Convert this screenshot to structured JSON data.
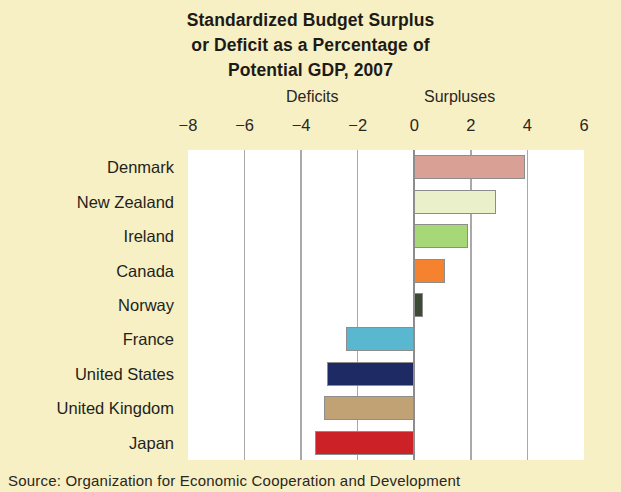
{
  "figure": {
    "title_lines": [
      "Standardized Budget Surplus",
      "or Deficit as a Percentage of",
      "Potential GDP, 2007"
    ],
    "deficits_label": "Deficits",
    "surpluses_label": "Surpluses",
    "source_note": "Source: Organization for Economic Cooperation and Development"
  },
  "chart_data": {
    "type": "bar",
    "orientation": "horizontal",
    "title": "Standardized Budget Surplus or Deficit as a Percentage of Potential GDP, 2007",
    "xlabel": "",
    "ylabel": "",
    "xlim": [
      -8,
      6
    ],
    "xticks": [
      -8,
      -6,
      -4,
      -2,
      0,
      2,
      4,
      6
    ],
    "xticklabels": [
      "−8",
      "−6",
      "−4",
      "−2",
      "0",
      "2",
      "4",
      "6"
    ],
    "grid": true,
    "legend": false,
    "annotations": [
      "Deficits",
      "Surpluses"
    ],
    "categories": [
      "Denmark",
      "New Zealand",
      "Ireland",
      "Canada",
      "Norway",
      "France",
      "United States",
      "United Kingdom",
      "Japan"
    ],
    "values": [
      3.9,
      2.9,
      1.9,
      1.1,
      0.3,
      -2.4,
      -3.1,
      -3.2,
      -3.5
    ],
    "colors": [
      "#d9a096",
      "#e9f0ca",
      "#a7d877",
      "#f5822f",
      "#3d4a36",
      "#59b8cf",
      "#1d2a63",
      "#c0a274",
      "#cc2126"
    ],
    "bar_border_color": "#8d8d8d",
    "plot_background": "#ffffff",
    "figure_background": "#f7f0c4"
  }
}
